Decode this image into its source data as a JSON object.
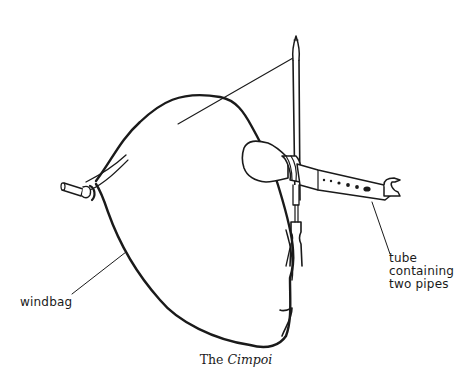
{
  "figure": {
    "labels": {
      "windbag": "windbag",
      "tube_line1": "tube",
      "tube_line2": "containing",
      "tube_line3": "two pipes"
    },
    "caption": {
      "prefix": "The ",
      "title": "Cimpoi"
    }
  },
  "colors": {
    "ink": "#1a1a1a",
    "background": "#ffffff"
  }
}
